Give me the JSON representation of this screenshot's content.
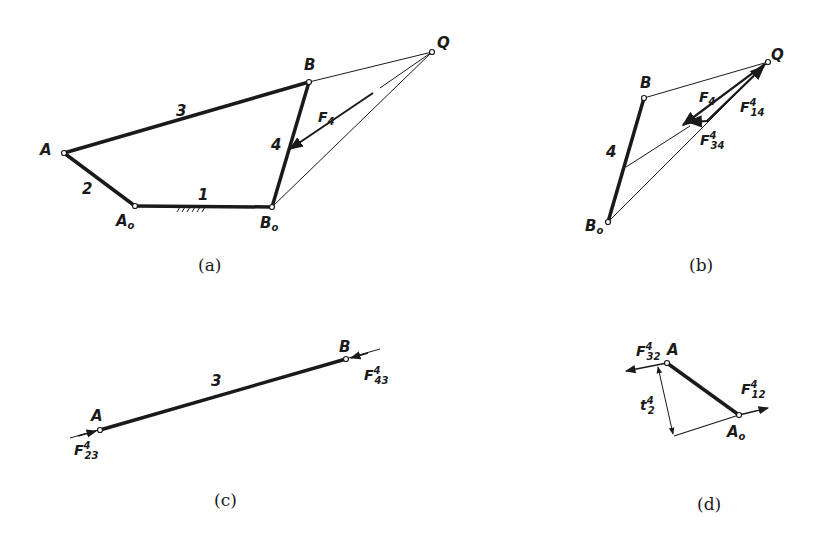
{
  "figure": {
    "panels": [
      {
        "id": "a",
        "caption": "(a)",
        "labels": {
          "A": "A",
          "B": "B",
          "A0": "A",
          "A0_sub": "o",
          "B0": "B",
          "B0_sub": "o",
          "Q": "Q",
          "link1": "1",
          "link2": "2",
          "link3": "3",
          "link4": "4",
          "F": "F",
          "F_sub": "4"
        }
      },
      {
        "id": "b",
        "caption": "(b)",
        "labels": {
          "B": "B",
          "B0": "B",
          "B0_sub": "o",
          "Q": "Q",
          "link4": "4",
          "F": "F",
          "F_sub": "4",
          "F14": "F",
          "F14_sup": "4",
          "F14_sub": "14",
          "F34": "F",
          "F34_sup": "4",
          "F34_sub": "34"
        }
      },
      {
        "id": "c",
        "caption": "(c)",
        "labels": {
          "A": "A",
          "B": "B",
          "link3": "3",
          "F23": "F",
          "F23_sup": "4",
          "F23_sub": "23",
          "F43": "F",
          "F43_sup": "4",
          "F43_sub": "43"
        }
      },
      {
        "id": "d",
        "caption": "(d)",
        "labels": {
          "A": "A",
          "A0": "A",
          "A0_sub": "o",
          "F32": "F",
          "F32_sup": "4",
          "F32_sub": "32",
          "F12": "F",
          "F12_sup": "4",
          "F12_sub": "12",
          "t2": "t",
          "t2_sup": "4",
          "t2_sub": "2"
        }
      }
    ]
  }
}
